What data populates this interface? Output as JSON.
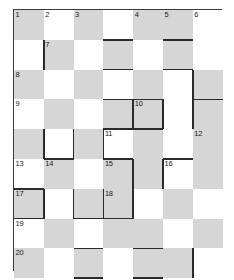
{
  "puzzle": {
    "type": "crossword-grid",
    "columns": 7,
    "rows": 9,
    "cell_size": 29.8,
    "shade_color": "#d6d6d6",
    "empty_color": "#ffffff",
    "border_color": "#3a3a3a",
    "number_color": "#1a1a1a",
    "clue_numbers": [
      {
        "n": "1",
        "col": 1,
        "row": 1
      },
      {
        "n": "2",
        "col": 2,
        "row": 1
      },
      {
        "n": "3",
        "col": 3,
        "row": 1
      },
      {
        "n": "4",
        "col": 5,
        "row": 1
      },
      {
        "n": "5",
        "col": 6,
        "row": 1
      },
      {
        "n": "6",
        "col": 7,
        "row": 1
      },
      {
        "n": "7",
        "col": 2,
        "row": 2
      },
      {
        "n": "8",
        "col": 1,
        "row": 3
      },
      {
        "n": "9",
        "col": 1,
        "row": 4
      },
      {
        "n": "10",
        "col": 5,
        "row": 4
      },
      {
        "n": "11",
        "col": 4,
        "row": 5
      },
      {
        "n": "12",
        "col": 7,
        "row": 5
      },
      {
        "n": "13",
        "col": 1,
        "row": 6
      },
      {
        "n": "14",
        "col": 2,
        "row": 6
      },
      {
        "n": "15",
        "col": 4,
        "row": 6
      },
      {
        "n": "16",
        "col": 6,
        "row": 6
      },
      {
        "n": "17",
        "col": 1,
        "row": 7
      },
      {
        "n": "18",
        "col": 4,
        "row": 7
      },
      {
        "n": "19",
        "col": 1,
        "row": 8
      },
      {
        "n": "20",
        "col": 1,
        "row": 9
      },
      {
        "n": "21",
        "col": 1,
        "row": 10
      }
    ],
    "shaded_cells": [
      {
        "col": 1,
        "row": 1
      },
      {
        "col": 3,
        "row": 1
      },
      {
        "col": 5,
        "row": 1
      },
      {
        "col": 6,
        "row": 1
      },
      {
        "col": 2,
        "row": 2
      },
      {
        "col": 4,
        "row": 2
      },
      {
        "col": 6,
        "row": 2
      },
      {
        "col": 1,
        "row": 3
      },
      {
        "col": 3,
        "row": 3
      },
      {
        "col": 5,
        "row": 3
      },
      {
        "col": 7,
        "row": 3
      },
      {
        "col": 2,
        "row": 4
      },
      {
        "col": 4,
        "row": 4
      },
      {
        "col": 5,
        "row": 4
      },
      {
        "col": 7,
        "row": 4
      },
      {
        "col": 1,
        "row": 5
      },
      {
        "col": 3,
        "row": 5
      },
      {
        "col": 5,
        "row": 5
      },
      {
        "col": 7,
        "row": 5
      },
      {
        "col": 2,
        "row": 6
      },
      {
        "col": 4,
        "row": 6
      },
      {
        "col": 5,
        "row": 6
      },
      {
        "col": 7,
        "row": 6
      },
      {
        "col": 1,
        "row": 7
      },
      {
        "col": 3,
        "row": 7
      },
      {
        "col": 4,
        "row": 7
      },
      {
        "col": 6,
        "row": 7
      },
      {
        "col": 2,
        "row": 8
      },
      {
        "col": 4,
        "row": 8
      },
      {
        "col": 5,
        "row": 8
      },
      {
        "col": 7,
        "row": 8
      },
      {
        "col": 1,
        "row": 9
      },
      {
        "col": 3,
        "row": 9
      },
      {
        "col": 5,
        "row": 9
      },
      {
        "col": 6,
        "row": 9
      },
      {
        "col": 2,
        "row": 10
      },
      {
        "col": 4,
        "row": 10
      },
      {
        "col": 6,
        "row": 10
      }
    ],
    "thick_edges": [
      {
        "orient": "h",
        "col": 4,
        "row": 2,
        "side": "top"
      },
      {
        "orient": "h",
        "col": 6,
        "row": 2,
        "side": "top"
      },
      {
        "orient": "h",
        "col": 4,
        "row": 2,
        "side": "bottom"
      },
      {
        "orient": "h",
        "col": 6,
        "row": 2,
        "side": "bottom"
      },
      {
        "orient": "v",
        "col": 2,
        "row": 2,
        "side": "left"
      },
      {
        "orient": "h",
        "col": 4,
        "row": 4,
        "side": "top"
      },
      {
        "orient": "h",
        "col": 5,
        "row": 4,
        "side": "top"
      },
      {
        "orient": "h",
        "col": 7,
        "row": 4,
        "side": "top"
      },
      {
        "orient": "v",
        "col": 5,
        "row": 4,
        "side": "left"
      },
      {
        "orient": "v",
        "col": 5,
        "row": 4,
        "side": "right"
      },
      {
        "orient": "v",
        "col": 4,
        "row": 4,
        "side": "right"
      },
      {
        "orient": "v",
        "col": 7,
        "row": 4,
        "side": "left"
      },
      {
        "orient": "h",
        "col": 4,
        "row": 4,
        "side": "bottom"
      },
      {
        "orient": "h",
        "col": 5,
        "row": 4,
        "side": "bottom"
      },
      {
        "orient": "v",
        "col": 4,
        "row": 5,
        "side": "left"
      },
      {
        "orient": "v",
        "col": 2,
        "row": 5,
        "side": "left"
      },
      {
        "orient": "v",
        "col": 2,
        "row": 5,
        "side": "right"
      },
      {
        "orient": "h",
        "col": 4,
        "row": 5,
        "side": "bottom"
      },
      {
        "orient": "h",
        "col": 2,
        "row": 5,
        "side": "bottom"
      },
      {
        "orient": "v",
        "col": 6,
        "row": 6,
        "side": "left"
      },
      {
        "orient": "h",
        "col": 6,
        "row": 6,
        "side": "top"
      },
      {
        "orient": "v",
        "col": 5,
        "row": 6,
        "side": "left"
      },
      {
        "orient": "h",
        "col": 1,
        "row": 7,
        "side": "top"
      },
      {
        "orient": "v",
        "col": 1,
        "row": 7,
        "side": "right"
      },
      {
        "orient": "h",
        "col": 1,
        "row": 7,
        "side": "bottom"
      },
      {
        "orient": "v",
        "col": 3,
        "row": 7,
        "side": "left"
      },
      {
        "orient": "v",
        "col": 3,
        "row": 7,
        "side": "right"
      },
      {
        "orient": "h",
        "col": 3,
        "row": 7,
        "side": "bottom"
      },
      {
        "orient": "v",
        "col": 4,
        "row": 7,
        "side": "left"
      },
      {
        "orient": "v",
        "col": 4,
        "row": 7,
        "side": "right"
      },
      {
        "orient": "h",
        "col": 4,
        "row": 7,
        "side": "bottom"
      },
      {
        "orient": "h",
        "col": 3,
        "row": 9,
        "side": "top"
      },
      {
        "orient": "h",
        "col": 5,
        "row": 9,
        "side": "top"
      },
      {
        "orient": "h",
        "col": 3,
        "row": 9,
        "side": "bottom"
      },
      {
        "orient": "h",
        "col": 5,
        "row": 9,
        "side": "bottom"
      },
      {
        "orient": "v",
        "col": 7,
        "row": 9,
        "side": "left"
      },
      {
        "orient": "v",
        "col": 6,
        "row": 3,
        "side": "right"
      },
      {
        "orient": "v",
        "col": 5,
        "row": 6,
        "side": "right"
      }
    ]
  }
}
